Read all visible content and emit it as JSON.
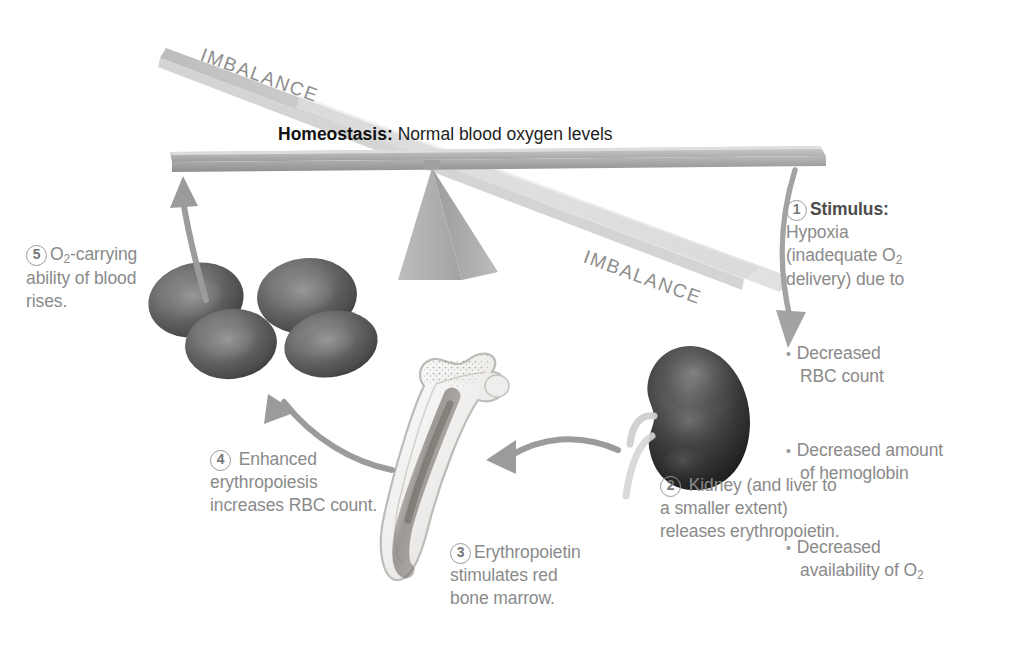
{
  "diagram": {
    "balance": {
      "homeostasis_bold": "Homeostasis:",
      "homeostasis_text": " Normal blood oxygen levels",
      "imbalance_top": "IMBALANCE",
      "imbalance_bottom": "IMBALANCE"
    },
    "steps": [
      {
        "number": "1",
        "heading": "Stimulus:",
        "body_line1": "Hypoxia",
        "body_line2": "(inadequate O",
        "body_sub2": "2",
        "body_line3": "delivery) due to",
        "bullets": [
          "Decreased RBC count",
          "Decreased amount of hemoglobin",
          "Decreased availability of O2"
        ],
        "bullet1": "Decreased\nRBC count",
        "bullet2": "Decreased amount\nof hemoglobin",
        "bullet3a": "Decreased\navailability of O",
        "bullet3sub": "2"
      },
      {
        "number": "2",
        "text": " Kidney (and liver to\na smaller extent)\nreleases erythropoietin."
      },
      {
        "number": "3",
        "text": "Erythropoietin\nstimulates red\nbone marrow."
      },
      {
        "number": "4",
        "text": " Enhanced\nerythropoiesis\nincreases RBC count."
      },
      {
        "number": "5",
        "text_a": "O",
        "text_sub": "2",
        "text_b": "-carrying\nability of blood\nrises."
      }
    ],
    "illustrations": [
      {
        "name": "kidney",
        "label": "kidney"
      },
      {
        "name": "red-blood-cells",
        "label": "red blood cells"
      },
      {
        "name": "femur-bone-marrow",
        "label": "red bone marrow in femur"
      },
      {
        "name": "balance-scale",
        "label": "tilting balance beam with fulcrum"
      }
    ],
    "arrows": [
      {
        "name": "arrow-beam-to-kidney",
        "from": "balance beam right end",
        "to": "kidney"
      },
      {
        "name": "arrow-kidney-to-bone",
        "from": "kidney",
        "to": "bone marrow"
      },
      {
        "name": "arrow-bone-to-rbc",
        "from": "bone marrow",
        "to": "red blood cells"
      },
      {
        "name": "arrow-rbc-to-beam",
        "from": "red blood cells",
        "to": "balance beam left end"
      }
    ],
    "colors": {
      "text_gray": "#8a8a8a",
      "heading_dark": "#4d4d4d",
      "arrow_gray": "#9b9b9b",
      "beam_gray": "#a9a9a9",
      "beam_light": "#d8d8d8",
      "fulcrum_gray": "#b3b3b3",
      "background": "#ffffff"
    }
  }
}
